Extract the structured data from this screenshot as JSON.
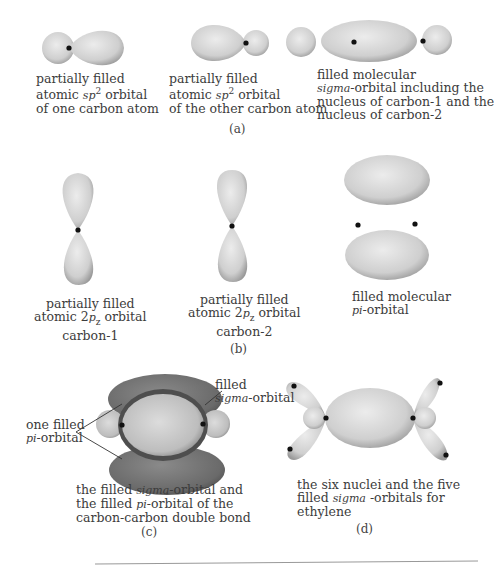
{
  "panels": {
    "a": {
      "label": "(a)",
      "items": [
        {
          "line1": "partially filled",
          "line2_pre": "atomic ",
          "line2_it": "sp",
          "line2_sup": "2",
          "line2_post": " orbital",
          "line3": "of one carbon atom"
        },
        {
          "line1": "partially filled",
          "line2_pre": "atomic ",
          "line2_it": "sp",
          "line2_sup": "2",
          "line2_post": " orbital",
          "line3": "of the other carbon atom"
        },
        {
          "line1": "filled molecular",
          "line2_it": "sigma",
          "line2_post": "-orbital including the",
          "line3": "nucleus of carbon-1 and the",
          "line4": "nucleus of carbon-2"
        }
      ]
    },
    "b": {
      "label": "(b)",
      "items": [
        {
          "line1": "partially filled",
          "line2_pre": "atomic 2",
          "line2_it": "p",
          "line2_sub": "z",
          "line2_post": " orbital",
          "line3": "carbon-1"
        },
        {
          "line1": "partially filled",
          "line2_pre": "atomic 2",
          "line2_it": "p",
          "line2_sub": "z",
          "line2_post": " orbital",
          "line3": "carbon-2"
        },
        {
          "line1": "filled molecular",
          "line2_it": "pi",
          "line2_post": "-orbital"
        }
      ]
    },
    "c": {
      "label": "(c)",
      "left_label_line1": "one filled",
      "left_label_it": "pi",
      "left_label_post": "-orbital",
      "right_label_line1": "filled",
      "right_label_it": "sigma",
      "right_label_post": "-orbital",
      "caption_line1_pre": "the filled ",
      "caption_line1_it": "sigma",
      "caption_line1_post": "-orbital and",
      "caption_line2_pre": "the filled ",
      "caption_line2_it": "pi",
      "caption_line2_post": "-orbital of the",
      "caption_line3": "carbon-carbon double bond"
    },
    "d": {
      "label": "(d)",
      "caption_line1": "the six nuclei and the five",
      "caption_line2_pre": "filled ",
      "caption_line2_it": "sigma",
      "caption_line2_post": " -orbitals for",
      "caption_line3": "ethylene"
    }
  },
  "colors": {
    "orbital_light": "#e6e6e6",
    "orbital_mid": "#b5b5b5",
    "orbital_dark_pi": "#6e6e6e",
    "nucleus": "#111111"
  }
}
